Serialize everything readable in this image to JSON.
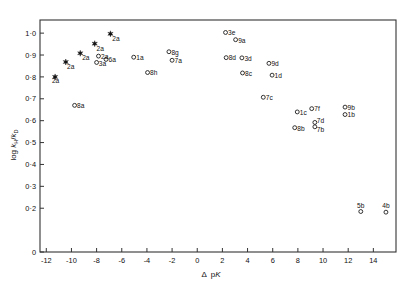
{
  "chart_data": {
    "type": "scatter",
    "title": "",
    "xlabel": "Δ pK",
    "ylabel": "log kH/kD",
    "xlim": [
      -12.5,
      15.8
    ],
    "ylim": [
      0.0,
      1.06
    ],
    "grid": false,
    "legend": "none",
    "xticks": [
      -12,
      -10,
      -8,
      -6,
      -4,
      -2,
      0,
      2,
      4,
      6,
      8,
      10,
      12,
      14
    ],
    "xticklabels": [
      "-12",
      "-10",
      "-8",
      "-6",
      "-4",
      "-2",
      "0",
      "2",
      "4",
      "6",
      "8",
      "10",
      "12",
      "14"
    ],
    "yticks": [
      0,
      0.2,
      0.3,
      0.4,
      0.5,
      0.6,
      0.7,
      0.8,
      0.9,
      1.0
    ],
    "yticklabels": [
      "0",
      "0·2",
      "0·3",
      "0·4",
      "0·5",
      "0·6",
      "0·7",
      "0·8",
      "0·9",
      "1·0"
    ],
    "marker_types": [
      "open-circle",
      "filled-star"
    ],
    "points": [
      {
        "label": "2a",
        "x": -11.3,
        "y": 0.8,
        "marker": "filled-star",
        "lx": -11.55,
        "ly": 0.782,
        "anchor": "start"
      },
      {
        "label": "2a",
        "x": -10.45,
        "y": 0.868,
        "marker": "filled-star",
        "lx": -10.35,
        "ly": 0.848,
        "anchor": "start"
      },
      {
        "label": "2a",
        "x": -9.3,
        "y": 0.908,
        "marker": "filled-star",
        "lx": -9.15,
        "ly": 0.888,
        "anchor": "start"
      },
      {
        "label": "2a",
        "x": -8.15,
        "y": 0.952,
        "marker": "filled-star",
        "lx": -8.0,
        "ly": 0.93,
        "anchor": "start"
      },
      {
        "label": "2a",
        "x": -6.9,
        "y": 0.997,
        "marker": "filled-star",
        "lx": -6.75,
        "ly": 0.973,
        "anchor": "start"
      },
      {
        "label": "2a",
        "x": -7.85,
        "y": 0.895,
        "marker": "open-circle",
        "lx": -7.65,
        "ly": 0.893,
        "anchor": "start"
      },
      {
        "label": "6a",
        "x": -7.25,
        "y": 0.88,
        "marker": "open-circle",
        "lx": -7.05,
        "ly": 0.878,
        "anchor": "start"
      },
      {
        "label": "3a",
        "x": -8.0,
        "y": 0.866,
        "marker": "open-circle",
        "lx": -7.82,
        "ly": 0.862,
        "anchor": "start"
      },
      {
        "label": "1a",
        "x": -5.05,
        "y": 0.89,
        "marker": "open-circle",
        "lx": -4.85,
        "ly": 0.888,
        "anchor": "start"
      },
      {
        "label": "8h",
        "x": -3.95,
        "y": 0.82,
        "marker": "open-circle",
        "lx": -3.75,
        "ly": 0.818,
        "anchor": "start"
      },
      {
        "label": "8g",
        "x": -2.25,
        "y": 0.915,
        "marker": "open-circle",
        "lx": -2.05,
        "ly": 0.913,
        "anchor": "start"
      },
      {
        "label": "7a",
        "x": -2.0,
        "y": 0.876,
        "marker": "open-circle",
        "lx": -1.8,
        "ly": 0.874,
        "anchor": "start"
      },
      {
        "label": "3e",
        "x": 2.25,
        "y": 1.003,
        "marker": "open-circle",
        "lx": 2.45,
        "ly": 1.001,
        "anchor": "start"
      },
      {
        "label": "9a",
        "x": 3.05,
        "y": 0.97,
        "marker": "open-circle",
        "lx": 3.25,
        "ly": 0.968,
        "anchor": "start"
      },
      {
        "label": "8d",
        "x": 2.3,
        "y": 0.888,
        "marker": "open-circle",
        "lx": 2.5,
        "ly": 0.886,
        "anchor": "start"
      },
      {
        "label": "3d",
        "x": 3.55,
        "y": 0.887,
        "marker": "open-circle",
        "lx": 3.75,
        "ly": 0.885,
        "anchor": "start"
      },
      {
        "label": "8c",
        "x": 3.6,
        "y": 0.818,
        "marker": "open-circle",
        "lx": 3.8,
        "ly": 0.816,
        "anchor": "start"
      },
      {
        "label": "9d",
        "x": 5.7,
        "y": 0.862,
        "marker": "open-circle",
        "lx": 5.9,
        "ly": 0.86,
        "anchor": "start"
      },
      {
        "label": "1d",
        "x": 5.95,
        "y": 0.808,
        "marker": "open-circle",
        "lx": 6.15,
        "ly": 0.806,
        "anchor": "start"
      },
      {
        "label": "7c",
        "x": 5.25,
        "y": 0.707,
        "marker": "open-circle",
        "lx": 5.45,
        "ly": 0.705,
        "anchor": "start"
      },
      {
        "label": "8a",
        "x": -9.75,
        "y": 0.67,
        "marker": "open-circle",
        "lx": -9.55,
        "ly": 0.668,
        "anchor": "start"
      },
      {
        "label": "1c",
        "x": 7.95,
        "y": 0.64,
        "marker": "open-circle",
        "lx": 8.15,
        "ly": 0.638,
        "anchor": "start"
      },
      {
        "label": "7f",
        "x": 9.1,
        "y": 0.655,
        "marker": "open-circle",
        "lx": 9.3,
        "ly": 0.653,
        "anchor": "start"
      },
      {
        "label": "9b",
        "x": 11.75,
        "y": 0.662,
        "marker": "open-circle",
        "lx": 11.95,
        "ly": 0.66,
        "anchor": "start"
      },
      {
        "label": "1b",
        "x": 11.75,
        "y": 0.628,
        "marker": "open-circle",
        "lx": 11.95,
        "ly": 0.626,
        "anchor": "start"
      },
      {
        "label": "8b",
        "x": 7.75,
        "y": 0.568,
        "marker": "open-circle",
        "lx": 7.95,
        "ly": 0.566,
        "anchor": "start"
      },
      {
        "label": "7d",
        "x": 9.35,
        "y": 0.592,
        "marker": "open-circle",
        "lx": 9.5,
        "ly": 0.6,
        "anchor": "start"
      },
      {
        "label": "7b",
        "x": 9.35,
        "y": 0.572,
        "marker": "open-circle",
        "lx": 9.5,
        "ly": 0.561,
        "anchor": "start"
      },
      {
        "label": "5b",
        "x": 13.0,
        "y": 0.185,
        "marker": "open-circle",
        "lx": 13.0,
        "ly": 0.213,
        "anchor": "middle"
      },
      {
        "label": "4b",
        "x": 15.0,
        "y": 0.182,
        "marker": "open-circle",
        "lx": 15.0,
        "ly": 0.212,
        "anchor": "middle"
      }
    ]
  },
  "axes": {
    "ylabel_prefix": "log ",
    "ylabel_k1": "k",
    "ylabel_sub1": "H",
    "ylabel_slash": "/",
    "ylabel_k2": "k",
    "ylabel_sub2": "D",
    "xlabel_delta": "Δ",
    "xlabel_p": "p",
    "xlabel_k": "K"
  }
}
